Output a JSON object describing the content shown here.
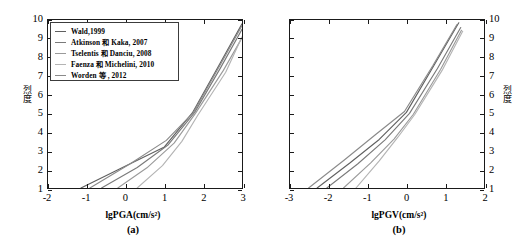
{
  "figure": {
    "panels": [
      {
        "id": "a",
        "panel_label": "(a)",
        "xlabel": "lgPGA(cm/s²)",
        "ylabel": "烈度",
        "yaxis_side": "left",
        "xticks": [
          "-2",
          "-1",
          "0",
          "1",
          "2",
          "3"
        ],
        "yticks": [
          "1",
          "2",
          "3",
          "4",
          "5",
          "6",
          "7",
          "8",
          "9",
          "10"
        ]
      },
      {
        "id": "b",
        "panel_label": "(b)",
        "xlabel": "lgPGV(cm/s²)",
        "ylabel": "烈度",
        "yaxis_side": "right",
        "xticks": [
          "-3",
          "-2",
          "-1",
          "0",
          "1",
          "2"
        ],
        "yticks": [
          "1",
          "2",
          "3",
          "4",
          "5",
          "6",
          "7",
          "8",
          "9",
          "10"
        ]
      }
    ],
    "legend": {
      "entries": [
        {
          "label": "Wald,1999",
          "color": "#606060"
        },
        {
          "label": "Atkinson 和 Kaka, 2007",
          "color": "#7a7a7a"
        },
        {
          "label": "Tselentis 和 Danciu, 2008",
          "color": "#9a9a9a"
        },
        {
          "label": "Faenza 和 Michelini, 2010",
          "color": "#b4b4b4"
        },
        {
          "label": "Worden 等 , 2012",
          "color": "#8a8a8a"
        }
      ]
    }
  },
  "chart_data": [
    {
      "type": "line",
      "title": "",
      "panel": "(a)",
      "xlabel": "lgPGA(cm/s²)",
      "ylabel": "烈度",
      "xlim": [
        -2,
        3
      ],
      "ylim": [
        1,
        10
      ],
      "xticks": [
        -2,
        -1,
        0,
        1,
        2,
        3
      ],
      "yticks": [
        1,
        2,
        3,
        4,
        5,
        6,
        7,
        8,
        9,
        10
      ],
      "grid": false,
      "legend_position": "upper-left",
      "series": [
        {
          "name": "Wald,1999",
          "color": "#606060",
          "x": [
            -1.15,
            0.0,
            1.0,
            1.72,
            2.4,
            3.0
          ],
          "y": [
            1.0,
            2.18,
            3.2,
            5.02,
            7.55,
            9.8
          ]
        },
        {
          "name": "Atkinson 和 Kaka, 2007",
          "color": "#7a7a7a",
          "x": [
            -0.62,
            0.3,
            1.1,
            1.78,
            2.45,
            3.0
          ],
          "y": [
            1.0,
            2.1,
            3.32,
            5.05,
            7.45,
            9.5
          ]
        },
        {
          "name": "Tselentis 和 Danciu, 2008",
          "color": "#9a9a9a",
          "x": [
            -0.2,
            0.55,
            1.25,
            1.8,
            2.52,
            3.0
          ],
          "y": [
            1.0,
            2.08,
            3.4,
            5.0,
            7.3,
            9.05
          ]
        },
        {
          "name": "Faenza 和 Michelini, 2010",
          "color": "#b4b4b4",
          "x": [
            0.3,
            0.95,
            1.45,
            1.86,
            2.58,
            3.0
          ],
          "y": [
            1.0,
            2.2,
            3.5,
            4.9,
            7.2,
            9.1
          ]
        },
        {
          "name": "Worden 等 , 2012",
          "color": "#8a8a8a",
          "x": [
            -0.92,
            0.12,
            1.05,
            1.75,
            2.44,
            3.0
          ],
          "y": [
            1.0,
            2.3,
            3.55,
            5.05,
            7.6,
            9.7
          ]
        }
      ]
    },
    {
      "type": "line",
      "title": "",
      "panel": "(b)",
      "xlabel": "lgPGV(cm/s²)",
      "ylabel": "烈度",
      "xlim": [
        -3,
        2
      ],
      "ylim": [
        1,
        10
      ],
      "xticks": [
        -3,
        -2,
        -1,
        0,
        1,
        2
      ],
      "yticks": [
        1,
        2,
        3,
        4,
        5,
        6,
        7,
        8,
        9,
        10
      ],
      "grid": false,
      "legend_position": "none",
      "series": [
        {
          "name": "Wald,1999",
          "color": "#606060",
          "x": [
            -2.3,
            -1.45,
            -0.7,
            0.0,
            0.72,
            1.35
          ],
          "y": [
            1.0,
            2.35,
            3.6,
            5.05,
            7.6,
            9.85
          ]
        },
        {
          "name": "Atkinson 和 Kaka, 2007",
          "color": "#7a7a7a",
          "x": [
            -2.05,
            -1.25,
            -0.55,
            0.08,
            0.8,
            1.4
          ],
          "y": [
            1.0,
            2.3,
            3.58,
            5.0,
            7.4,
            9.6
          ]
        },
        {
          "name": "Tselentis 和 Danciu, 2008",
          "color": "#9a9a9a",
          "x": [
            -1.62,
            -0.92,
            -0.32,
            0.18,
            0.88,
            1.42
          ],
          "y": [
            1.0,
            2.35,
            3.62,
            4.95,
            7.35,
            9.45
          ]
        },
        {
          "name": "Faenza 和 Michelini, 2010",
          "color": "#b4b4b4",
          "x": [
            -1.3,
            -0.7,
            -0.22,
            0.22,
            0.92,
            1.45
          ],
          "y": [
            1.0,
            2.45,
            3.72,
            4.95,
            7.3,
            9.4
          ]
        },
        {
          "name": "Worden 等 , 2012",
          "color": "#8a8a8a",
          "x": [
            -2.52,
            -1.6,
            -0.8,
            -0.05,
            0.68,
            1.3
          ],
          "y": [
            1.0,
            2.5,
            3.85,
            5.1,
            7.55,
            9.75
          ]
        }
      ]
    }
  ]
}
